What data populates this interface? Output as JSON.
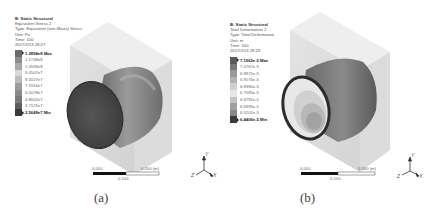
{
  "panels": [
    {
      "id": "a",
      "caption": "(a)",
      "header": {
        "title": "B: Static Structural",
        "line1": "Equivalent Stress 2",
        "line2": "Type: Equivalent (von-Mises) Stress",
        "line3": "Unit: Pa",
        "line4": "Time: 100",
        "line5": "2017/2/13 28:27"
      },
      "legend": {
        "max": "1.2894e8 Max",
        "levels": [
          "1.1748e8",
          "1.0595e8",
          "9.4507e7",
          "8.3027e7",
          "7.1554e7",
          "6.0078e7",
          "4.8602e7",
          "3.7125e7"
        ],
        "min": "2.5649e7 Min",
        "colors": [
          "#6a6a6a",
          "#8c8c8c",
          "#a8a8a8",
          "#bcbcbc",
          "#d4d4d4",
          "#bdbdbd",
          "#9c9c9c",
          "#8a8a8a",
          "#7a7a7a",
          "#5a5a5a",
          "#3a3a3a"
        ]
      },
      "scale": {
        "start": "0.000",
        "mid": "0.100",
        "end": "0.200 (m)"
      },
      "axes": {
        "y": "Y",
        "z": "Z",
        "x": "X"
      }
    },
    {
      "id": "b",
      "caption": "(b)",
      "header": {
        "title": "B: Static Structural",
        "line1": "Total Deformation 2",
        "line2": "Type: Total Deformation",
        "line3": "Unit: m",
        "line4": "Time: 100",
        "line5": "2017/2/13 28:29"
      },
      "legend": {
        "max": "7.1562e-5 Max",
        "levels": [
          "7.0767e-5",
          "6.9971e-5",
          "6.9176e-5",
          "6.8380e-5",
          "6.7585e-5",
          "6.6791e-5",
          "6.5995e-5",
          "6.5201e-5"
        ],
        "min": "6.4406e-5 Min",
        "colors": [
          "#5a5a5a",
          "#787878",
          "#999999",
          "#b2b2b2",
          "#cfcfcf",
          "#e6e6e6",
          "#c4c4c4",
          "#a0a0a0",
          "#888888",
          "#6e6e6e",
          "#3a3a3a"
        ]
      },
      "scale": {
        "start": "0.000",
        "mid": "0.100",
        "end": "0.300 (m)"
      },
      "axes": {
        "y": "Y",
        "z": "Z",
        "x": "X"
      }
    }
  ]
}
